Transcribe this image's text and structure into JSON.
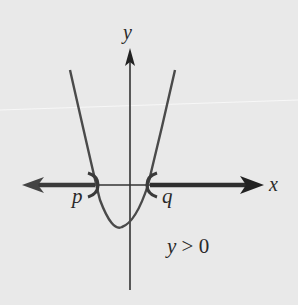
{
  "figure": {
    "type": "parabola-inequality-diagram",
    "axes": {
      "x_label": "x",
      "y_label": "y"
    },
    "curve": {
      "kind": "upward-opening parabola",
      "roots": [
        "p",
        "q"
      ],
      "endpoints_marked": "open (parentheses) at p and q"
    },
    "roots": {
      "left": "p",
      "right": "q"
    },
    "condition": {
      "variable": "y",
      "operator": ">",
      "value": "0"
    },
    "colors": {
      "background": "#e9e9e9",
      "ink": "#2a2a2a",
      "curve": "#4a4a4a"
    }
  }
}
